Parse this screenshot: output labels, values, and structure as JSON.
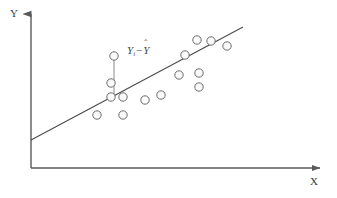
{
  "figure": {
    "background_color": "#ffffff",
    "axis_color": "#5a5a5a",
    "line_color": "#4a4a4a",
    "marker_edge_color": "#6b6b6b",
    "marker_fill_color": "#fbfbfb"
  },
  "axes": {
    "y_label": "Y",
    "x_label": "X",
    "origin": {
      "x": 31,
      "y": 168
    },
    "y_axis_top": {
      "x": 31,
      "y": 10
    },
    "x_axis_right": {
      "x": 326,
      "y": 168
    }
  },
  "annotation": {
    "residual_text": "Yi - Ŷ",
    "residual_y": "Y",
    "residual_subscript": "i",
    "residual_minus": "−",
    "residual_yhat_base": "Y",
    "residual_yhat_accent": "ˆ",
    "segment": {
      "x": 114,
      "y_top": 56,
      "y_bottom": 96
    }
  },
  "chart_data": {
    "type": "scatter",
    "title": "",
    "xlabel": "X",
    "ylabel": "Y",
    "grid": false,
    "legend": null,
    "xlim": [
      31,
      326
    ],
    "ylim": [
      168,
      10
    ],
    "note": "Axis values are unlabeled; coordinates are in pixel space of the figure (y increases downward).",
    "points": [
      {
        "x": 97,
        "y": 115
      },
      {
        "x": 111,
        "y": 97
      },
      {
        "x": 111,
        "y": 83
      },
      {
        "x": 114,
        "y": 56
      },
      {
        "x": 123,
        "y": 115
      },
      {
        "x": 123,
        "y": 97
      },
      {
        "x": 145,
        "y": 100
      },
      {
        "x": 161,
        "y": 95
      },
      {
        "x": 179,
        "y": 75
      },
      {
        "x": 185,
        "y": 55
      },
      {
        "x": 197,
        "y": 40
      },
      {
        "x": 199,
        "y": 87
      },
      {
        "x": 199,
        "y": 73
      },
      {
        "x": 211,
        "y": 41
      },
      {
        "x": 227,
        "y": 46
      }
    ],
    "marker_radius": 4.2,
    "fit_line": {
      "name": "regression line",
      "x1": 31,
      "y1": 140,
      "x2": 243,
      "y2": 27
    }
  }
}
